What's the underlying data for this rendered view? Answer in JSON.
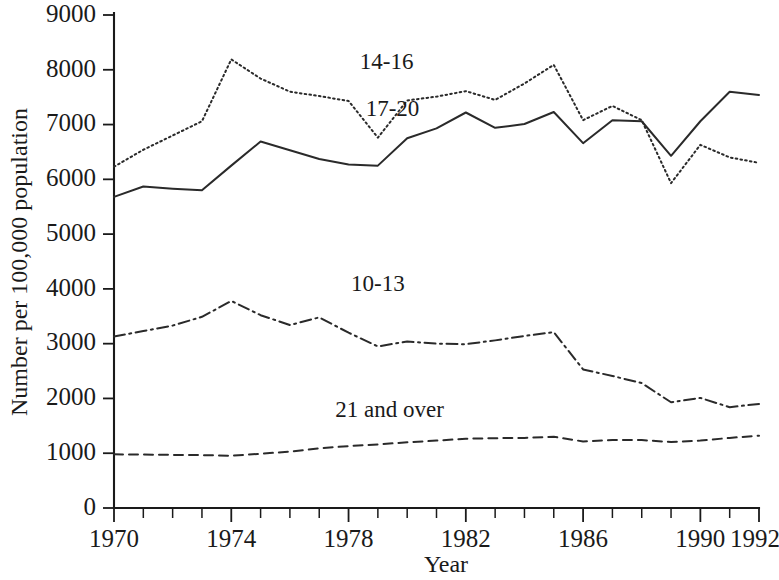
{
  "chart_data": {
    "type": "line",
    "title": "",
    "xlabel": "Year",
    "ylabel": "Number per 100,000 population",
    "xlim": [
      1970,
      1992
    ],
    "ylim": [
      0,
      9000
    ],
    "grid": false,
    "legend_position": "inline-annotations",
    "x": [
      1970,
      1971,
      1972,
      1973,
      1974,
      1975,
      1976,
      1977,
      1978,
      1979,
      1980,
      1981,
      1982,
      1983,
      1984,
      1985,
      1986,
      1987,
      1988,
      1989,
      1990,
      1991,
      1992
    ],
    "xtick_labels": [
      "1970",
      "1974",
      "1978",
      "1982",
      "1986",
      "1990",
      "1992"
    ],
    "xtick_values": [
      1970,
      1974,
      1978,
      1982,
      1986,
      1990,
      1992
    ],
    "ytick_labels": [
      "0",
      "1000",
      "2000",
      "3000",
      "4000",
      "5000",
      "6000",
      "7000",
      "8000",
      "9000"
    ],
    "ytick_values": [
      0,
      1000,
      2000,
      3000,
      4000,
      5000,
      6000,
      7000,
      8000,
      9000
    ],
    "series": [
      {
        "name": "14-16",
        "label": "14-16",
        "line_style": "dotted",
        "color": "#2a2a2a",
        "label_x": 1979.3,
        "label_y": 8010,
        "values": [
          6230,
          6540,
          6800,
          7060,
          8190,
          7840,
          7600,
          7520,
          7430,
          6760,
          7440,
          7510,
          7610,
          7450,
          7750,
          8090,
          7080,
          7340,
          7080,
          5930,
          6630,
          6400,
          6300
        ]
      },
      {
        "name": "17-20",
        "label": "17-20",
        "line_style": "solid",
        "color": "#2a2a2a",
        "label_x": 1979.5,
        "label_y": 7150,
        "values": [
          5680,
          5870,
          5830,
          5800,
          6250,
          6690,
          6530,
          6370,
          6270,
          6250,
          6750,
          6930,
          7220,
          6940,
          7010,
          7230,
          6660,
          7080,
          7060,
          6430,
          7060,
          7600,
          7540
        ]
      },
      {
        "name": "10-13",
        "label": "10-13",
        "line_style": "dashdot",
        "color": "#2a2a2a",
        "label_x": 1979.0,
        "label_y": 3960,
        "values": [
          3130,
          3230,
          3330,
          3490,
          3780,
          3520,
          3340,
          3480,
          3200,
          2950,
          3040,
          3000,
          2990,
          3060,
          3140,
          3210,
          2530,
          2410,
          2280,
          1930,
          2010,
          1840,
          1900
        ]
      },
      {
        "name": "21 and over",
        "label": "21 and over",
        "line_style": "dashed",
        "color": "#2a2a2a",
        "label_x": 1979.4,
        "label_y": 1670,
        "values": [
          980,
          975,
          970,
          965,
          955,
          990,
          1030,
          1090,
          1130,
          1160,
          1200,
          1230,
          1265,
          1275,
          1280,
          1300,
          1215,
          1240,
          1240,
          1205,
          1230,
          1280,
          1320
        ]
      }
    ]
  },
  "axes": {
    "y_title": "Number per 100,000 population",
    "x_title": "Year"
  }
}
